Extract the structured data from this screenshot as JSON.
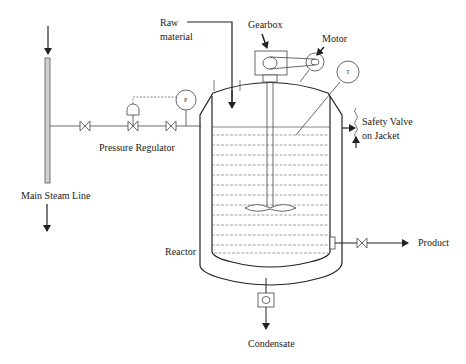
{
  "diagram": {
    "type": "process flow diagram",
    "labels": {
      "raw_material_line1": "Raw",
      "raw_material_line2": "material",
      "gearbox": "Gearbox",
      "motor": "Motor",
      "pressure_regulator": "Pressure Regulator",
      "safety_valve_line1": "Safety  Valve",
      "safety_valve_line2": "on Jacket",
      "main_steam_line": "Main Steam Line",
      "reactor": "Reactor",
      "product": "Product",
      "condensate": "Condensate"
    },
    "instruments": {
      "pressure_gauge": "P",
      "temperature_gauge": "T"
    },
    "components": [
      {
        "name": "Main Steam Line",
        "symbol": "vertical-pipe",
        "flow": "downward"
      },
      {
        "name": "Isolation valve 1",
        "symbol": "gate-valve"
      },
      {
        "name": "Pressure Regulator",
        "symbol": "control-valve-with-diaphragm-actuator"
      },
      {
        "name": "Isolation valve 2",
        "symbol": "gate-valve"
      },
      {
        "name": "Pressure gauge",
        "symbol": "circle-instrument",
        "tag": "P"
      },
      {
        "name": "Reactor",
        "symbol": "jacketed-vessel"
      },
      {
        "name": "Gearbox",
        "symbol": "rectangle"
      },
      {
        "name": "Motor",
        "symbol": "circle"
      },
      {
        "name": "Agitator",
        "symbol": "shaft-with-impeller"
      },
      {
        "name": "Temperature gauge",
        "symbol": "circle-instrument",
        "tag": "T"
      },
      {
        "name": "Safety Valve on Jacket",
        "symbol": "relief-valve"
      },
      {
        "name": "Product valve",
        "symbol": "gate-valve"
      },
      {
        "name": "Steam trap",
        "symbol": "trap-box"
      }
    ],
    "colors": {
      "line": "#222222",
      "steam_pipe_fill": "#d0d0d0",
      "liquid_dash": "#555555",
      "background": "#ffffff"
    }
  }
}
